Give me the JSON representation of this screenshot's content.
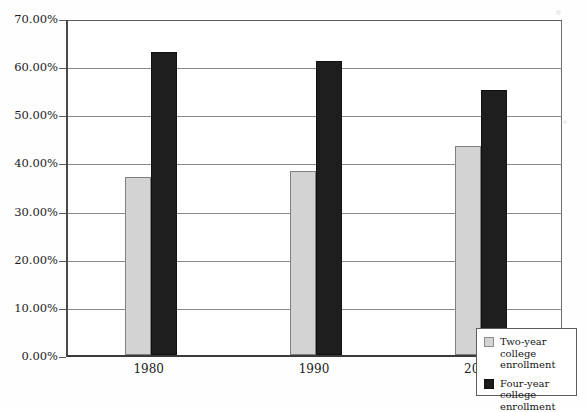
{
  "chart_data": {
    "type": "bar",
    "title": "",
    "xlabel": "",
    "ylabel": "",
    "categories": [
      "1980",
      "1990",
      "2000"
    ],
    "series": [
      {
        "name": "Two-year college enrollment",
        "color": "#d3d3d3",
        "values": [
          37.0,
          38.3,
          43.5
        ]
      },
      {
        "name": "Four-year college enrollment",
        "color": "#1e1e1e",
        "values": [
          63.0,
          61.0,
          55.0
        ]
      }
    ],
    "ylim": [
      0,
      70
    ],
    "ytick_labels": [
      "0.00%",
      "10.00%",
      "20.00%",
      "30.00%",
      "40.00%",
      "50.00%",
      "60.00%",
      "70.00%"
    ],
    "ytick_values": [
      0,
      10,
      20,
      30,
      40,
      50,
      60,
      70
    ],
    "grid": true,
    "legend_position": "bottom-right"
  },
  "legend": {
    "entries": [
      {
        "label": "Two-year college enrollment",
        "swatch": "two-year"
      },
      {
        "label": "Four-year college enrollment",
        "swatch": "four-year"
      }
    ]
  }
}
